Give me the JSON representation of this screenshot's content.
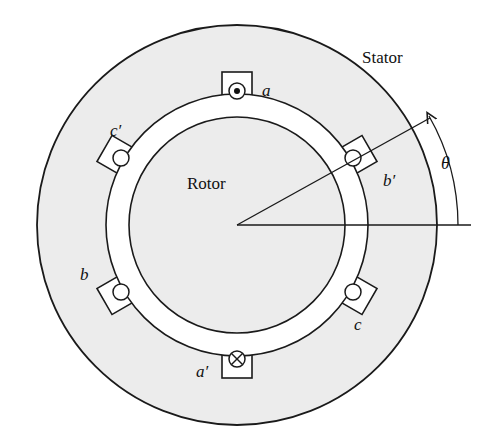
{
  "labels": {
    "stator": "Stator",
    "rotor": "Rotor",
    "theta": "θ",
    "slot_a": "a",
    "slot_a_prime": "a′",
    "slot_b": "b",
    "slot_b_prime": "b′",
    "slot_c": "c",
    "slot_c_prime": "c′"
  },
  "conductors": {
    "a": "dot (current out of page)",
    "a_prime": "cross (current into page)",
    "b": "empty",
    "b_prime": "empty",
    "c": "empty",
    "c_prime": "empty"
  },
  "colors": {
    "fill": "#ececec",
    "stroke": "#1a1a1a",
    "background": "#ffffff"
  }
}
